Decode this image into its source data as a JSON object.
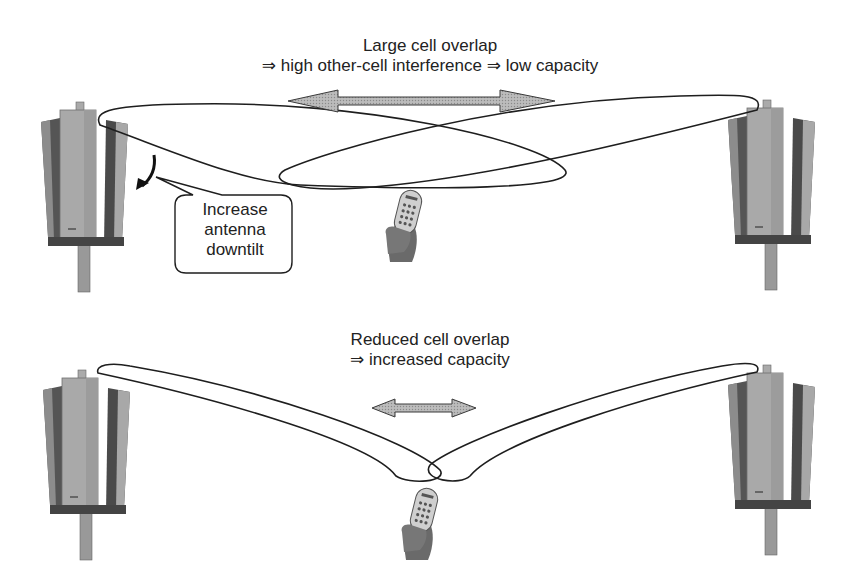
{
  "top_panel": {
    "caption_line1": "Large cell overlap",
    "caption_line2": "⇒ high other-cell interference ⇒ low capacity",
    "callout_line1": "Increase",
    "callout_line2": "antenna",
    "callout_line3": "downtilt"
  },
  "bottom_panel": {
    "caption_line1": "Reduced cell overlap",
    "caption_line2": "⇒ increased capacity"
  },
  "icons": {
    "antenna": "sector-antenna-mast",
    "handset": "mobile-phone-in-hand",
    "overlap_arrow": "double-headed-arrow",
    "tilt_arrow": "curved-down-arrow"
  },
  "colors": {
    "arrow_fill": "#b4b4b4",
    "line": "#1e1e1e",
    "antenna_panel": "#9a9a9a"
  }
}
